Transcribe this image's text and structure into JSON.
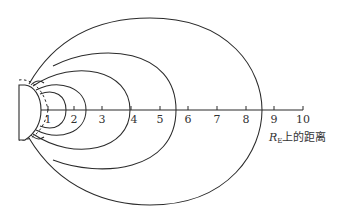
{
  "figure": {
    "axis": {
      "title_main": "R",
      "title_sub": "E",
      "title_suffix": "上的距离",
      "ticks": [
        "1",
        "2",
        "3",
        "4",
        "5",
        "6",
        "7",
        "8",
        "9",
        "10"
      ]
    },
    "field_line_crossings_RE": [
      1.5,
      2.5,
      4.0,
      5.7,
      8.6
    ],
    "colors": {
      "line": "#2b2b2b",
      "text": "#333333",
      "background": "#ffffff"
    }
  }
}
